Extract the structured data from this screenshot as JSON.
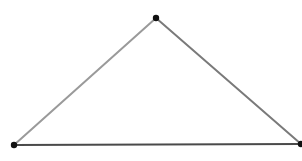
{
  "diagram": {
    "type": "triangle",
    "background": "#ffffff",
    "vertices": [
      {
        "id": "top",
        "x": 156,
        "y": 18
      },
      {
        "id": "bottom-left",
        "x": 14,
        "y": 145
      },
      {
        "id": "bottom-right",
        "x": 301,
        "y": 144
      }
    ],
    "edges": [
      {
        "id": "left-edge",
        "from": "bottom-left",
        "to": "top",
        "color": "#9a9a9a",
        "width": 2
      },
      {
        "id": "right-edge",
        "from": "top",
        "to": "bottom-right",
        "color": "#7a7a7a",
        "width": 2
      },
      {
        "id": "base-edge",
        "from": "bottom-left",
        "to": "bottom-right",
        "color": "#4a4a4a",
        "width": 2
      }
    ],
    "vertex_color": "#111111",
    "vertex_radius": 3.2
  }
}
